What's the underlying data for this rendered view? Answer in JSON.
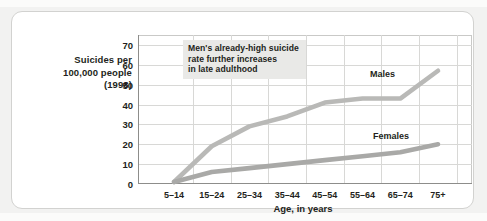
{
  "chart_data": {
    "type": "line",
    "title": "",
    "ylabel": "Suicides per 100,000 people (1998)",
    "ylabel_lines": [
      "Suicides per",
      "100,000 people",
      "(1998)"
    ],
    "xlabel": "Age, in years",
    "categories": [
      "5–14",
      "15–24",
      "25–34",
      "35–44",
      "45–54",
      "55–64",
      "65–74",
      "75+"
    ],
    "yticks": [
      0,
      10,
      20,
      30,
      40,
      50,
      60,
      70
    ],
    "ylim": [
      0,
      75
    ],
    "grid": true,
    "legend_position": "inline-labels",
    "series": [
      {
        "name": "Males",
        "color": "#b9b9b7",
        "values": [
          1,
          19,
          29,
          34,
          41,
          43,
          43,
          57
        ]
      },
      {
        "name": "Females",
        "color": "#a9a9a7",
        "values": [
          1,
          6,
          8,
          10,
          12,
          14,
          16,
          20
        ]
      }
    ],
    "annotations": [
      {
        "name": "males-late-adulthood-note",
        "lines": [
          "Men's already-high suicide",
          "rate further increases",
          "in late adulthood"
        ],
        "background": "#e9e9e7"
      }
    ]
  }
}
